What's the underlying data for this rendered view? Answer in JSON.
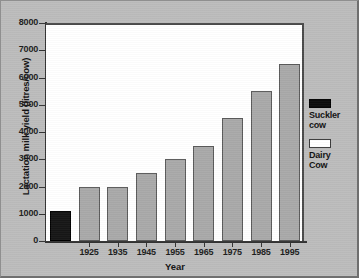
{
  "chart_data": {
    "type": "bar",
    "title": "",
    "xlabel": "Year",
    "ylabel": "Lactation milk yield (litres/cow)",
    "ylim": [
      0,
      8000
    ],
    "ytick_labels": [
      "8000",
      "7000",
      "6000",
      "5000",
      "4000",
      "3000",
      "2000",
      "1000",
      "0"
    ],
    "yticks": [
      8000,
      7000,
      6000,
      5000,
      4000,
      3000,
      2000,
      1000,
      0
    ],
    "grid": false,
    "legend_position": "right",
    "categories": [
      "",
      "1925",
      "1935",
      "1945",
      "1955",
      "1965",
      "1975",
      "1985",
      "1995"
    ],
    "xtick_labels": [
      "1925",
      "1935",
      "1945",
      "1955",
      "1965",
      "1975",
      "1985",
      "1995"
    ],
    "bars": [
      {
        "category": "",
        "label": "",
        "value": 1100,
        "series": "Suckler cow"
      },
      {
        "category": "1925",
        "label": "1925",
        "value": 2000,
        "series": "Dairy Cow"
      },
      {
        "category": "1935",
        "label": "1935",
        "value": 2000,
        "series": "Dairy Cow"
      },
      {
        "category": "1945",
        "label": "1945",
        "value": 2500,
        "series": "Dairy Cow"
      },
      {
        "category": "1955",
        "label": "1955",
        "value": 3000,
        "series": "Dairy Cow"
      },
      {
        "category": "1965",
        "label": "1965",
        "value": 3500,
        "series": "Dairy Cow"
      },
      {
        "category": "1975",
        "label": "1975",
        "value": 4500,
        "series": "Dairy Cow"
      },
      {
        "category": "1985",
        "label": "1985",
        "value": 5500,
        "series": "Dairy Cow"
      },
      {
        "category": "1995",
        "label": "1995",
        "value": 6500,
        "series": "Dairy Cow"
      }
    ],
    "series": [
      {
        "name": "Suckler cow",
        "values": [
          1100,
          null,
          null,
          null,
          null,
          null,
          null,
          null,
          null
        ],
        "color": "#0d0d0d"
      },
      {
        "name": "Dairy Cow",
        "values": [
          null,
          2000,
          2000,
          2500,
          3000,
          3500,
          4500,
          5500,
          6500
        ],
        "color": "#a9a9a9"
      }
    ]
  },
  "legend": {
    "entries": [
      {
        "swatch": "filled",
        "line1": "Suckler",
        "line2": "cow"
      },
      {
        "swatch": "hollow",
        "line1": "Dairy",
        "line2": "Cow"
      }
    ]
  },
  "colors": {
    "panel_background": "#bcbcbc",
    "plot_background": "#ffffff",
    "axis": "#333333",
    "dairy_bar_fill": "#a9a9a9",
    "dairy_bar_border": "#5a5a5a",
    "suckler_bar_fill": "#0d0d0d",
    "text": "#121212"
  }
}
